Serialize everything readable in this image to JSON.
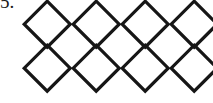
{
  "worksheet": {
    "item_number": "5.",
    "background_color": "#ffffff",
    "stroke_color": "#161616"
  },
  "shapes": {
    "icon_name": "diamond-outline-icon",
    "shape_name": "diamond",
    "total_count": 8,
    "rows": 2,
    "columns": 4,
    "stroke_width": 3.2,
    "cell_width": 46,
    "cell_height": 46,
    "column_spacing": 49,
    "row_spacing": 46,
    "origin_x": 24,
    "origin_y": 0,
    "items": [
      {
        "row": 1,
        "col": 1,
        "x": 24,
        "y": 1
      },
      {
        "row": 1,
        "col": 2,
        "x": 73,
        "y": 1
      },
      {
        "row": 1,
        "col": 3,
        "x": 122,
        "y": 1
      },
      {
        "row": 1,
        "col": 4,
        "x": 171,
        "y": 1
      },
      {
        "row": 2,
        "col": 1,
        "x": 24,
        "y": 45
      },
      {
        "row": 2,
        "col": 2,
        "x": 73,
        "y": 45
      },
      {
        "row": 2,
        "col": 3,
        "x": 122,
        "y": 45
      },
      {
        "row": 2,
        "col": 4,
        "x": 171,
        "y": 45
      }
    ]
  }
}
